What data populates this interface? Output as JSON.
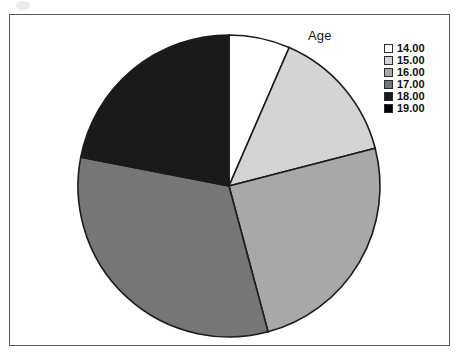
{
  "chart": {
    "title": "Age",
    "frame_border_color": "#5a5a5a",
    "background": "#ffffff"
  },
  "legend": {
    "position": "top-right",
    "entries": [
      {
        "label": "14.00",
        "color": "#ffffff"
      },
      {
        "label": "15.00",
        "color": "#d4d4d4"
      },
      {
        "label": "16.00",
        "color": "#a8a8a8"
      },
      {
        "label": "17.00",
        "color": "#767676"
      },
      {
        "label": "18.00",
        "color": "#1a1a1a"
      },
      {
        "label": "19.00",
        "color": "#000000"
      }
    ]
  },
  "chart_data": {
    "type": "pie",
    "title": "Age",
    "xlabel": "",
    "ylabel": "",
    "legend_position": "top-right",
    "grid": false,
    "start_angle_deg": 0,
    "direction": "clockwise",
    "categories": [
      "14.00",
      "15.00",
      "16.00",
      "17.00",
      "18.00",
      "19.00"
    ],
    "colors": [
      "#ffffff",
      "#d4d4d4",
      "#a8a8a8",
      "#767676",
      "#1a1a1a",
      "#000000"
    ],
    "angles_deg": [
      23.5,
      52.0,
      89.5,
      116.0,
      79.0,
      0.0
    ],
    "values": [
      6.5,
      14.4,
      24.9,
      32.2,
      21.9,
      0.0
    ],
    "slices": [
      {
        "label": "14.00",
        "color": "#ffffff",
        "start_deg": 0.0,
        "end_deg": 23.5,
        "sweep_deg": 23.5,
        "percent": 6.5
      },
      {
        "label": "15.00",
        "color": "#d4d4d4",
        "start_deg": 23.5,
        "end_deg": 75.5,
        "sweep_deg": 52.0,
        "percent": 14.4
      },
      {
        "label": "16.00",
        "color": "#a8a8a8",
        "start_deg": 75.5,
        "end_deg": 165.0,
        "sweep_deg": 89.5,
        "percent": 24.9
      },
      {
        "label": "17.00",
        "color": "#767676",
        "start_deg": 165.0,
        "end_deg": 281.0,
        "sweep_deg": 116.0,
        "percent": 32.2
      },
      {
        "label": "18.00",
        "color": "#1a1a1a",
        "start_deg": 281.0,
        "end_deg": 360.0,
        "sweep_deg": 79.0,
        "percent": 21.9
      },
      {
        "label": "19.00",
        "color": "#000000",
        "start_deg": 360.0,
        "end_deg": 360.0,
        "sweep_deg": 0.0,
        "percent": 0.0
      }
    ],
    "geometry": {
      "center_x": 219,
      "center_y": 171,
      "radius": 151
    }
  }
}
